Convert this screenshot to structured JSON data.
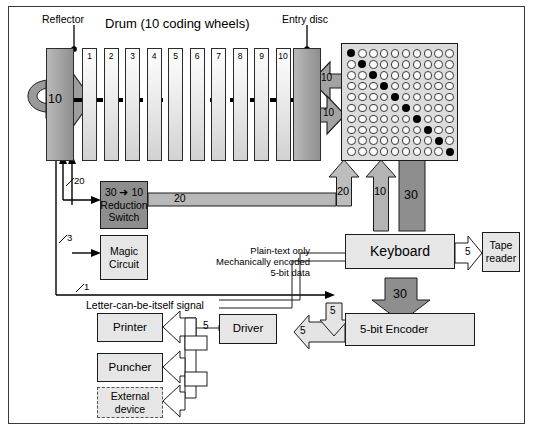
{
  "figure": {
    "title_top": "Drum (10 coding wheels)",
    "labels": {
      "reflector": "Reflector",
      "entry_disc": "Entry disc",
      "letter_signal": "Letter-can-be-itself signal",
      "plaintext_note_line1": "Plain-text only",
      "plaintext_note_line2": "Mechanically encoded",
      "plaintext_note_line3": "5-bit data"
    }
  },
  "drum": {
    "wheel_numbers": [
      "1",
      "2",
      "3",
      "4",
      "5",
      "6",
      "7",
      "8",
      "9",
      "10"
    ],
    "wheel_directions": [
      "down",
      "up",
      "down",
      "up",
      "down",
      "up",
      "down",
      "up",
      "down",
      "up"
    ],
    "reflector_arrow_value": "10",
    "entry_arrow_left_value": "10",
    "entry_arrow_right_value": "10"
  },
  "matrix": {
    "rows": 10,
    "cols": 10,
    "filled_pattern": "diagonal",
    "filled_cells": [
      [
        0,
        0
      ],
      [
        1,
        1
      ],
      [
        2,
        2
      ],
      [
        3,
        3
      ],
      [
        4,
        4
      ],
      [
        5,
        5
      ],
      [
        6,
        6
      ],
      [
        7,
        7
      ],
      [
        8,
        8
      ],
      [
        9,
        9
      ]
    ],
    "out_arrow_left_value": "20",
    "out_arrow_right_value": "10",
    "bus_value": "30"
  },
  "boxes": {
    "reduction_switch_line1": "30 ➜ 10",
    "reduction_switch_line2": "Reduction",
    "reduction_switch_line3": "Switch",
    "magic_circuit_line1": "Magic",
    "magic_circuit_line2": "Circuit",
    "keyboard": "Keyboard",
    "tape_reader_line1": "Tape",
    "tape_reader_line2": "reader",
    "printer": "Printer",
    "puncher": "Puncher",
    "external_device_line1": "External",
    "external_device_line2": "device",
    "driver": "Driver",
    "encoder": "5-bit Encoder"
  },
  "signals": {
    "reflector_feedback_20": "20",
    "magic_circuit_3": "3",
    "letter_itself_1": "1",
    "reduction_out_20": "20",
    "keyboard_in_30": "30",
    "keyboard_out_30": "30",
    "tape_reader_5": "5",
    "encoder_to_driver_5": "5",
    "encoder_down_5": "5",
    "driver_to_printer_5": "5"
  },
  "colors": {
    "dark_band": "#8e8e8e",
    "mid_band": "#b3b3b3",
    "box_fill": "#e6e6e6",
    "frame": "#3a3a3a",
    "stroke": "#1a1a1a"
  }
}
